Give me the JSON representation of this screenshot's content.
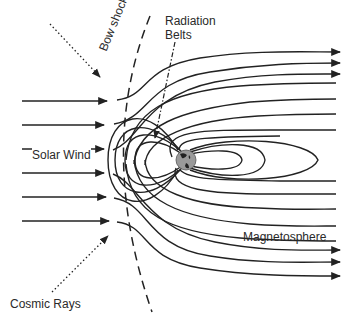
{
  "diagram": {
    "type": "magnetosphere",
    "labels": {
      "bow_shock": "Bow shock",
      "radiation_belts_line1": "Radiation",
      "radiation_belts_line2": "Belts",
      "solar_wind": "Solar Wind",
      "magnetosphere": "Magnetosphere",
      "cosmic_rays": "Cosmic Rays"
    },
    "colors": {
      "line": "#222222",
      "text": "#2a2a2a",
      "earth": "#9a9a9a",
      "background": "#ffffff"
    },
    "elements": {
      "solar_wind_arrows": 6,
      "outflow_arrows_top": 3,
      "outflow_arrows_bottom": 3,
      "cosmic_ray_arrows": 2
    }
  }
}
